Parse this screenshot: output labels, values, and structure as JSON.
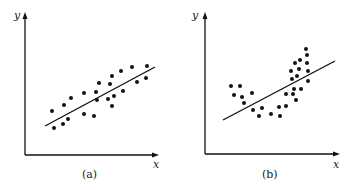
{
  "chart_data": [
    {
      "type": "scatter",
      "panel": "(a)",
      "xlabel": "x",
      "ylabel": "y",
      "caption": "(a)",
      "grid": false,
      "description": "Linear trend with scatter around a fitted line",
      "points_px": [
        [
          52,
          111
        ],
        [
          54,
          128
        ],
        [
          64,
          105
        ],
        [
          63,
          124
        ],
        [
          68,
          119
        ],
        [
          71,
          98
        ],
        [
          84,
          93
        ],
        [
          84,
          114
        ],
        [
          94,
          116
        ],
        [
          96,
          92
        ],
        [
          97,
          100
        ],
        [
          99,
          83
        ],
        [
          108,
          99
        ],
        [
          110,
          84
        ],
        [
          112,
          76
        ],
        [
          112,
          106
        ],
        [
          114,
          96
        ],
        [
          121,
          71
        ],
        [
          123,
          91
        ],
        [
          132,
          67
        ],
        [
          137,
          82
        ],
        [
          147,
          66
        ],
        [
          146,
          78
        ]
      ],
      "fit_line_px": [
        [
          45,
          126
        ],
        [
          155,
          67
        ]
      ],
      "axes_px": {
        "origin": [
          25,
          155
        ],
        "y_top": 13,
        "x_right": 158
      }
    },
    {
      "type": "scatter",
      "panel": "(b)",
      "xlabel": "x",
      "ylabel": "y",
      "caption": "(b)",
      "grid": false,
      "description": "Curved (U-shaped) pattern poorly fit by a straight line",
      "points_px": [
        [
          231,
          86
        ],
        [
          234,
          95
        ],
        [
          240,
          86
        ],
        [
          242,
          97
        ],
        [
          244,
          103
        ],
        [
          252,
          93
        ],
        [
          253,
          110
        ],
        [
          259,
          116
        ],
        [
          262,
          108
        ],
        [
          271,
          114
        ],
        [
          279,
          107
        ],
        [
          280,
          116
        ],
        [
          286,
          106
        ],
        [
          286,
          94
        ],
        [
          291,
          71
        ],
        [
          292,
          79
        ],
        [
          293,
          94
        ],
        [
          294,
          89
        ],
        [
          296,
          100
        ],
        [
          295,
          63
        ],
        [
          297,
          76
        ],
        [
          299,
          69
        ],
        [
          300,
          60
        ],
        [
          301,
          89
        ],
        [
          306,
          49
        ],
        [
          307,
          55
        ],
        [
          307,
          63
        ],
        [
          308,
          71
        ],
        [
          308,
          81
        ]
      ],
      "fit_line_px": [
        [
          223,
          120
        ],
        [
          335,
          61
        ]
      ],
      "axes_px": {
        "origin": [
          205,
          154
        ],
        "y_top": 13,
        "x_right": 339
      }
    }
  ],
  "labels": {
    "a_x": "x",
    "a_y": "y",
    "a_caption": "(a)",
    "b_x": "x",
    "b_y": "y",
    "b_caption": "(b)"
  },
  "colors": {
    "ink": "#111111",
    "background": "#ffffff"
  }
}
